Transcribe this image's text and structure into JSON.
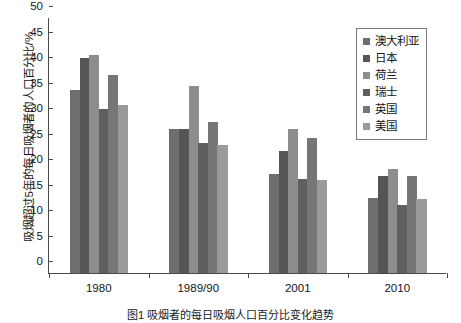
{
  "chart_data": {
    "type": "bar",
    "title": "",
    "xlabel": "",
    "ylabel": "吸烟超过5年的每日吸烟者的人口百分比/%",
    "categories": [
      "1980",
      "1989/90",
      "2001",
      "2010"
    ],
    "ylim": [
      0,
      50
    ],
    "ytick_labels": [
      "0",
      "5",
      "10",
      "15",
      "20",
      "25",
      "30",
      "35",
      "40",
      "45",
      "50"
    ],
    "ytick_values": [
      0,
      5,
      10,
      15,
      20,
      25,
      30,
      35,
      40,
      45,
      50
    ],
    "grid": false,
    "legend_position": "top-right",
    "series": [
      {
        "name": "澳大利亚",
        "color": "#6e6e6e",
        "values": [
          35.8,
          28.2,
          19.5,
          14.7
        ]
      },
      {
        "name": "日本",
        "color": "#555555",
        "values": [
          42.2,
          28.3,
          24.0,
          19.0
        ]
      },
      {
        "name": "荷兰",
        "color": "#8d8d8d",
        "values": [
          42.8,
          36.7,
          28.2,
          20.3
        ]
      },
      {
        "name": "瑞士",
        "color": "#5f5f5f",
        "values": [
          32.2,
          25.5,
          18.4,
          13.3
        ]
      },
      {
        "name": "英国",
        "color": "#767676",
        "values": [
          38.8,
          29.7,
          26.5,
          19.0
        ]
      },
      {
        "name": "美国",
        "color": "#9a9a9a",
        "values": [
          33.0,
          25.1,
          18.3,
          14.6
        ]
      }
    ]
  },
  "caption": "图1  吸烟者的每日吸烟人口百分比变化趋势"
}
